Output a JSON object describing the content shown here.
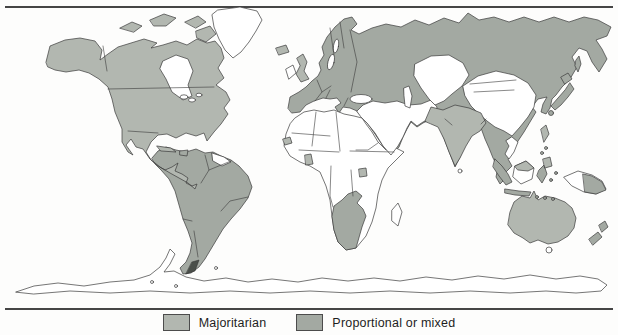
{
  "figure": {
    "colors": {
      "majoritarian": "#b2b7b0",
      "proportional_or_mixed": "#a3a9a2",
      "unshaded_land": "#ffffff",
      "ocean": "#fdfdfc",
      "coastline": "#3b3b3b",
      "rule_line": "#454545"
    },
    "legend": {
      "items": [
        {
          "id": "majoritarian",
          "label": "Majoritarian"
        },
        {
          "id": "proportional",
          "label": "Proportional or mixed"
        }
      ]
    }
  }
}
